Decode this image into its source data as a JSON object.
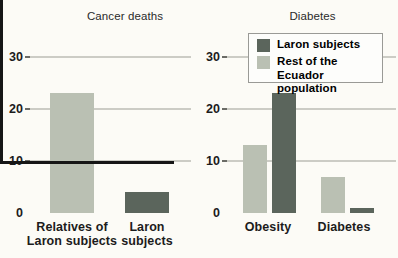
{
  "colors": {
    "laron_dark": "#5b655c",
    "rest_light": "#bac0b3",
    "background": "#fcfbf6",
    "axis": "#161616",
    "gridline": "#ccccc5",
    "stub": "#6b6b66",
    "text": "#1c1c1c",
    "title_text": "#2a2a2a",
    "legend_bg": "#fdfdfb",
    "legend_border": "#9a9a96"
  },
  "chart_data": [
    {
      "type": "bar",
      "title": "Cancer deaths",
      "categories": [
        "Relatives of Laron subjects",
        "Laron subjects"
      ],
      "category_lines": [
        [
          "Relatives of",
          "Laron subjects"
        ],
        [
          "Laron",
          "subjects"
        ]
      ],
      "values": [
        23,
        4
      ],
      "bar_color_keys": [
        "rest_light",
        "laron_dark"
      ],
      "xlabel": "",
      "ylabel": "",
      "ylim": [
        0,
        30
      ],
      "yticks": [
        0,
        10,
        20,
        30
      ],
      "grid": true,
      "legend_position": "none"
    },
    {
      "type": "bar",
      "title": "Diabetes",
      "categories": [
        "Obesity",
        "Diabetes"
      ],
      "category_lines": [
        [
          "Obesity"
        ],
        [
          "Diabetes"
        ]
      ],
      "series": [
        {
          "name": "Rest of the Ecuador population",
          "values": [
            13,
            7
          ],
          "color_key": "rest_light"
        },
        {
          "name": "Laron subjects",
          "values": [
            23,
            1
          ],
          "color_key": "laron_dark"
        }
      ],
      "xlabel": "",
      "ylabel": "",
      "ylim": [
        0,
        30
      ],
      "yticks": [
        0,
        10,
        20,
        30
      ],
      "grid": true,
      "legend": {
        "position": "top",
        "items": [
          {
            "label": "Laron subjects",
            "color_key": "laron_dark"
          },
          {
            "label": "Rest of the Ecuador population",
            "color_key": "rest_light"
          }
        ]
      }
    }
  ]
}
